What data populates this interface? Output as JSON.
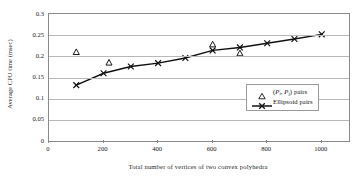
{
  "chart_data": {
    "type": "line",
    "title": "",
    "xlabel": "Total number of vertices of two convex polyhedra",
    "ylabel": "Average CPU time (msec)",
    "xlim": [
      0,
      1100
    ],
    "ylim": [
      0,
      0.3
    ],
    "xticks": [
      0,
      200,
      400,
      600,
      800,
      1000
    ],
    "xtick_labels": [
      "0",
      "200",
      "400",
      "600",
      "800",
      "1000"
    ],
    "yticks": [
      0,
      0.05,
      0.1,
      0.15,
      0.2,
      0.25,
      0.3
    ],
    "ytick_labels": [
      "0",
      "0.05",
      "0.1",
      "0.15",
      "0.2",
      "0.25",
      "0.3"
    ],
    "grid": "horizontal",
    "legend_position": "inside-lower-right",
    "series": [
      {
        "name": "(Pi, Pj) pairs",
        "marker": "triangle-open",
        "line": "none",
        "color": "#1a1a1a",
        "x": [
          100,
          220,
          600,
          700
        ],
        "values": [
          0.21,
          0.185,
          0.228,
          0.207
        ]
      },
      {
        "name": "Ellipsoid pairs",
        "marker": "x",
        "line": "solid",
        "color": "#101010",
        "x": [
          100,
          200,
          300,
          400,
          500,
          600,
          700,
          800,
          900,
          1000
        ],
        "values": [
          0.132,
          0.16,
          0.176,
          0.184,
          0.196,
          0.214,
          0.221,
          0.231,
          0.241,
          0.252
        ]
      }
    ]
  },
  "legend": {
    "entries": [
      {
        "marker_name": "triangle-marker",
        "label_prefix": "(",
        "p_i": "P",
        "sub_i": "i",
        "comma": ", ",
        "p_j": "P",
        "sub_j": "j",
        "label_suffix": ") pairs",
        "label_plain": "(Pi, Pj) pairs"
      },
      {
        "marker_name": "line-x-marker",
        "label_plain": "Ellipsoid pairs"
      }
    ]
  }
}
